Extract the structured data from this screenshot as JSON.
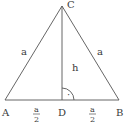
{
  "diagram": {
    "colors": {
      "stroke": "#555555",
      "text": "#3a3a3a",
      "background": "#ffffff"
    },
    "vertices": {
      "A": {
        "label": "A"
      },
      "B": {
        "label": "B"
      },
      "C": {
        "label": "C"
      },
      "D": {
        "label": "D"
      }
    },
    "sides": {
      "AC": {
        "label": "a"
      },
      "BC": {
        "label": "a"
      },
      "CD": {
        "label": "h"
      }
    },
    "segments": {
      "AD": {
        "numerator": "a",
        "denominator": "2"
      },
      "DB": {
        "numerator": "a",
        "denominator": "2"
      }
    },
    "right_angle_marker": {
      "symbol": "·"
    }
  }
}
